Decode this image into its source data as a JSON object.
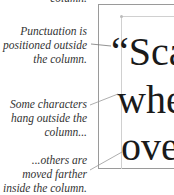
{
  "captions": {
    "top_partial": "column.",
    "punctuation": [
      "Punctuation is",
      "positioned outside",
      "the column."
    ],
    "hang": [
      "Some characters",
      "hang outside the",
      "column..."
    ],
    "inside": [
      "...others are",
      "moved farther",
      "inside the column."
    ]
  },
  "sample_text": {
    "line1": "“Sca",
    "line2": "whe",
    "line3": "ove"
  },
  "colors": {
    "frame": "#9a9a9a",
    "guide": "#d0d0d0",
    "text": "#1a1a1a",
    "caption": "#333333"
  }
}
